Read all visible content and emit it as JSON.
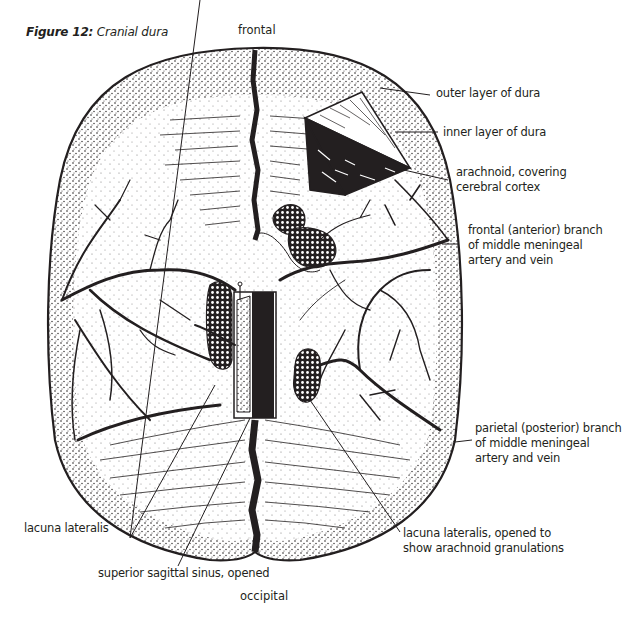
{
  "figure": {
    "number_label": "Figure 12:",
    "title": "Cranial dura"
  },
  "orientation": {
    "top": "frontal",
    "bottom": "occipital"
  },
  "labels": {
    "outer_layer": "outer layer of dura",
    "inner_layer": "inner layer of dura",
    "arachnoid_line1": "arachnoid, covering",
    "arachnoid_line2": "cerebral cortex",
    "frontal_branch_line1": "frontal (anterior) branch",
    "frontal_branch_line2": "of middle meningeal",
    "frontal_branch_line3": "artery and vein",
    "parietal_branch_line1": "parietal (posterior) branch",
    "parietal_branch_line2": "of middle meningeal",
    "parietal_branch_line3": "artery and vein",
    "lacuna_left": "lacuna lateralis",
    "lacuna_right_line1": "lacuna lateralis, opened to",
    "lacuna_right_line2": "show arachnoid granulations",
    "sagittal_sinus": "superior sagittal sinus, opened"
  },
  "colors": {
    "ink": "#231f20",
    "background": "#ffffff"
  }
}
